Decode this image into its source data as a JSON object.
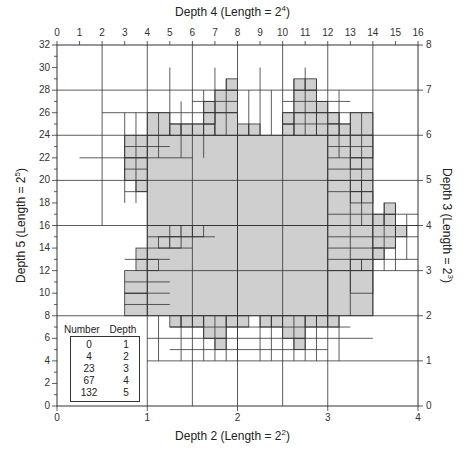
{
  "axes": {
    "top": {
      "title": "Depth 4 (Length = 2",
      "exp": "4",
      "ticks": [
        "0",
        "1",
        "2",
        "3",
        "4",
        "5",
        "6",
        "7",
        "8",
        "9",
        "10",
        "11",
        "12",
        "13",
        "14",
        "15",
        "16"
      ]
    },
    "bottom": {
      "title": "Depth 2 (Length = 2",
      "exp": "2",
      "ticks": [
        "0",
        "1",
        "2",
        "3",
        "4"
      ]
    },
    "left": {
      "title": "Depth 5 (Length = 2",
      "exp": "5",
      "ticks": [
        "0",
        "2",
        "4",
        "6",
        "8",
        "10",
        "12",
        "14",
        "16",
        "18",
        "20",
        "22",
        "24",
        "26",
        "28",
        "30",
        "32"
      ]
    },
    "right": {
      "title": "Depth 3 (Length = 2",
      "exp": "3",
      "ticks": [
        "0",
        "1",
        "2",
        "3",
        "4",
        "5",
        "6",
        "7",
        "8"
      ]
    }
  },
  "legend": {
    "headers": [
      "Number",
      "Depth"
    ],
    "rows": [
      {
        "number": "0",
        "depth": "1"
      },
      {
        "number": "4",
        "depth": "2"
      },
      {
        "number": "23",
        "depth": "3"
      },
      {
        "number": "67",
        "depth": "4"
      },
      {
        "number": "132",
        "depth": "5"
      }
    ]
  },
  "colors": {
    "fill": "#cfcfcf",
    "line": "#333333"
  },
  "grid": {
    "frame_px": {
      "left": 57,
      "top": 45,
      "size": 361
    },
    "units": 32,
    "shaded_cells": [
      [
        8,
        8,
        8
      ],
      [
        16,
        8,
        8
      ],
      [
        16,
        16,
        8
      ],
      [
        8,
        16,
        8
      ],
      [
        24,
        8,
        4
      ],
      [
        24,
        12,
        4
      ],
      [
        24,
        16,
        4
      ],
      [
        24,
        20,
        4
      ],
      [
        6,
        22,
        2
      ],
      [
        6,
        20,
        2
      ],
      [
        7,
        19,
        1
      ],
      [
        8,
        24,
        2
      ],
      [
        10,
        24,
        1
      ],
      [
        11,
        24,
        1
      ],
      [
        12,
        24,
        1
      ],
      [
        13,
        24,
        1
      ],
      [
        14,
        24,
        2
      ],
      [
        16,
        24,
        1
      ],
      [
        17,
        24,
        1
      ],
      [
        14,
        26,
        2
      ],
      [
        15,
        28,
        1
      ],
      [
        13,
        26,
        1
      ],
      [
        13,
        25,
        1
      ],
      [
        21,
        24,
        2
      ],
      [
        23,
        24,
        2
      ],
      [
        20,
        24,
        1
      ],
      [
        20,
        25,
        1
      ],
      [
        21,
        26,
        2
      ],
      [
        23,
        26,
        1
      ],
      [
        24,
        25,
        1
      ],
      [
        25,
        24,
        1
      ],
      [
        24,
        24,
        1
      ],
      [
        21,
        28,
        1
      ],
      [
        22,
        28,
        1
      ],
      [
        26,
        24,
        2
      ],
      [
        26,
        22,
        2
      ],
      [
        26,
        21,
        1
      ],
      [
        26,
        19,
        1
      ],
      [
        26,
        18,
        1
      ],
      [
        27,
        18,
        1
      ],
      [
        28,
        14,
        2
      ],
      [
        30,
        15,
        1
      ],
      [
        28,
        16,
        1
      ],
      [
        29,
        16,
        1
      ],
      [
        28,
        13,
        1
      ],
      [
        29,
        17,
        1
      ],
      [
        6,
        8,
        2
      ],
      [
        6,
        10,
        2
      ],
      [
        7,
        12,
        1
      ],
      [
        7,
        13,
        1
      ],
      [
        8,
        12,
        1
      ],
      [
        9,
        14,
        1
      ],
      [
        10,
        15,
        1
      ],
      [
        11,
        15,
        1
      ],
      [
        12,
        15,
        1
      ],
      [
        10,
        14,
        1
      ],
      [
        10,
        7,
        1
      ],
      [
        11,
        7,
        1
      ],
      [
        13,
        6,
        2
      ],
      [
        14,
        5,
        1
      ],
      [
        15,
        7,
        1
      ],
      [
        16,
        7,
        1
      ],
      [
        12,
        7,
        1
      ],
      [
        18,
        7,
        1
      ],
      [
        19,
        7,
        1
      ],
      [
        20,
        6,
        2
      ],
      [
        21,
        5,
        1
      ],
      [
        22,
        7,
        1
      ],
      [
        23,
        7,
        1
      ],
      [
        24,
        7,
        1
      ],
      [
        26,
        10,
        2
      ],
      [
        26,
        12,
        1
      ],
      [
        27,
        12,
        1
      ]
    ]
  }
}
